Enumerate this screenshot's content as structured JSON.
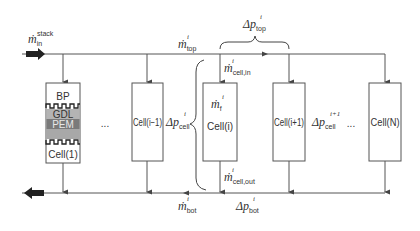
{
  "diagram": {
    "type": "fuel-cell-stack-manifold-flow",
    "inlet": {
      "symbol": "ṁ",
      "sub": "in",
      "sup": "stack"
    },
    "top_manifold": {
      "flow_label": {
        "symbol": "ṁ",
        "sub": "top",
        "sup": "i"
      },
      "pressure_drop": {
        "symbol": "Δp",
        "sub": "top",
        "sup": "i"
      }
    },
    "bottom_manifold": {
      "flow_label": {
        "symbol": "ṁ",
        "sub": "bot",
        "sup": "i"
      },
      "pressure_drop": {
        "symbol": "Δp",
        "sub": "bot",
        "sup": "i"
      }
    },
    "cell_in": {
      "symbol": "ṁ",
      "sub": "cell,in",
      "sup": "i"
    },
    "cell_out": {
      "symbol": "ṁ",
      "sub": "cell,out",
      "sup": "i"
    },
    "cell_internal": {
      "symbol": "ṁ",
      "sub": "f",
      "sup": "i"
    },
    "dp_cell_i": {
      "symbol": "Δp",
      "sub": "cell",
      "sup": "i"
    },
    "dp_cell_i1": {
      "symbol": "Δp",
      "sub": "cell",
      "sup": "i+1"
    },
    "ellipsis": "...",
    "cells": [
      {
        "label": "Cell(1)",
        "layers": [
          "BP",
          "GDL",
          "PEM"
        ]
      },
      {
        "label": "Cell(i−1)"
      },
      {
        "label": "Cell(i)"
      },
      {
        "label": "Cell(i+1)"
      },
      {
        "label": "Cell(N)"
      }
    ],
    "colors": {
      "line": "#555555",
      "gdl": "#b4b4b4",
      "pem": "#7a7a7a",
      "gdl_lower": "#a8a8a8",
      "text": "#333333"
    }
  }
}
